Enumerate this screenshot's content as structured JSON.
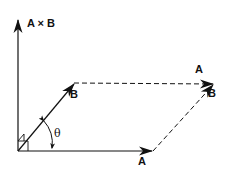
{
  "diagram": {
    "type": "vector-cross-product",
    "labels": {
      "cross_product": "A × B",
      "vector_a": "A",
      "vector_b": "B",
      "translated_a": "A",
      "translated_b": "B",
      "angle": "θ"
    },
    "colors": {
      "stroke": "#111111",
      "background": "#ffffff"
    },
    "geometry": {
      "origin": [
        18,
        151
      ],
      "axis_top": [
        18,
        20
      ],
      "a_tip": [
        153,
        151
      ],
      "b_tip": [
        74,
        83
      ],
      "sum_tip": [
        214,
        84
      ]
    }
  }
}
